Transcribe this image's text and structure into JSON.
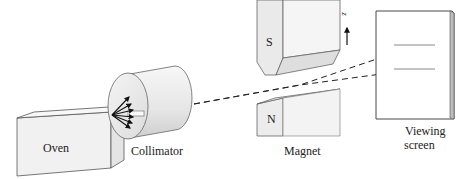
{
  "diagram": {
    "labels": {
      "oven": "Oven",
      "collimator": "Collimator",
      "magnet": "Magnet",
      "screen_line1": "Viewing",
      "screen_line2": "screen",
      "south_pole": "S",
      "north_pole": "N",
      "axis": "z"
    },
    "colors": {
      "stroke": "#333333",
      "fill_light": "#f2f2f2",
      "fill_mid": "#e2e2e2",
      "fill_dark": "#cfcfcf"
    }
  }
}
